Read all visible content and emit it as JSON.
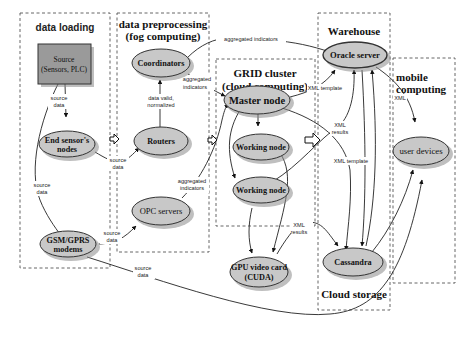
{
  "regions": {
    "data_loading": {
      "title": "data loading"
    },
    "preprocessing": {
      "title_line1": "data preprocessing",
      "title_line2": "(fog computing)"
    },
    "grid": {
      "title_line1": "GRID cluster",
      "title_line2": "(cloud computing)"
    },
    "warehouse": {
      "title": "Warehouse",
      "footer": "Cloud storage"
    },
    "mobile": {
      "title_line1": "mobile",
      "title_line2": "computing"
    }
  },
  "nodes": {
    "source": {
      "line1": "Source",
      "line2": "(Sensors, PLC)"
    },
    "end_sensor": {
      "line1": "End sensor's",
      "line2": "nodes"
    },
    "gsm": {
      "line1": "GSM/GPRS",
      "line2": "modems"
    },
    "coordinators": {
      "label": "Coordinators"
    },
    "routers": {
      "label": "Routers"
    },
    "opc": {
      "label": "OPC servers"
    },
    "master": {
      "label": "Master node"
    },
    "working1": {
      "label": "Working node"
    },
    "working2": {
      "label": "Working node"
    },
    "gpu": {
      "line1": "GPU video card",
      "line2": "(CUDA)"
    },
    "oracle": {
      "label": "Oracle server"
    },
    "cassandra": {
      "label": "Cassandra"
    },
    "user_devices": {
      "label": "user devices"
    }
  },
  "edge_labels": {
    "source_data_1": {
      "line1": "source",
      "line2": "data"
    },
    "source_data_2": {
      "line1": "source",
      "line2": "data"
    },
    "source_data_3": {
      "line1": "source",
      "line2": "data"
    },
    "source_data_4": {
      "line1": "source",
      "line2": "data"
    },
    "source_data_5": {
      "line1": "source",
      "line2": "data"
    },
    "data_valid": {
      "line1": "data valid,",
      "line2": "normalized"
    },
    "aggregated_top": {
      "label": "aggregated indicators"
    },
    "aggregated_coord": {
      "line1": "aggregated",
      "line2": "indicators"
    },
    "aggregated_opc": {
      "line1": "aggregated",
      "line2": "indicators"
    },
    "xml_template_1": {
      "label": "XML template"
    },
    "xml_template_2": {
      "label": "XML template"
    },
    "xml_results_1": {
      "line1": "XML",
      "line2": "results"
    },
    "xml_results_2": {
      "line1": "XML",
      "line2": "results"
    },
    "xml_mobile": {
      "label": "XML"
    }
  },
  "colors": {
    "node_fill": "#c8c8c8",
    "source_fill": "#9a9a9a",
    "line": "#222222",
    "background": "#ffffff"
  }
}
